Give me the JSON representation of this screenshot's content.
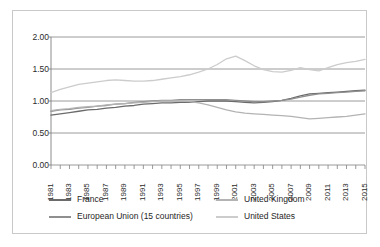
{
  "chart_data": {
    "type": "line",
    "title": "",
    "subtitle": "",
    "xlabel": "",
    "ylabel": "",
    "grid": true,
    "legend_position": "bottom",
    "ylim": [
      0.0,
      2.0
    ],
    "ytick_labels": [
      "2.00",
      "1.50",
      "1.00",
      "0.50",
      "0.00"
    ],
    "ytick_values": [
      2.0,
      1.5,
      1.0,
      0.5,
      0.0
    ],
    "xlim": [
      1981,
      2015
    ],
    "xtick_labels": [
      "1981",
      "1983",
      "1985",
      "1987",
      "1989",
      "1991",
      "1993",
      "1995",
      "1997",
      "1999",
      "2001",
      "2003",
      "2005",
      "2007",
      "2009",
      "2011",
      "2013",
      "2015"
    ],
    "x": [
      1981,
      1982,
      1983,
      1984,
      1985,
      1986,
      1987,
      1988,
      1989,
      1990,
      1991,
      1992,
      1993,
      1994,
      1995,
      1996,
      1997,
      1998,
      1999,
      2000,
      2001,
      2002,
      2003,
      2004,
      2005,
      2006,
      2007,
      2008,
      2009,
      2010,
      2011,
      2012,
      2013,
      2014,
      2015
    ],
    "series": [
      {
        "name": "France",
        "color": "#6b6b6b",
        "values": [
          0.78,
          0.8,
          0.82,
          0.84,
          0.86,
          0.87,
          0.89,
          0.9,
          0.92,
          0.93,
          0.95,
          0.96,
          0.97,
          0.97,
          0.98,
          0.98,
          0.99,
          1.0,
          1.0,
          1.0,
          0.99,
          0.98,
          0.97,
          0.98,
          0.99,
          1.01,
          1.04,
          1.08,
          1.11,
          1.12,
          1.13,
          1.14,
          1.15,
          1.16,
          1.17
        ]
      },
      {
        "name": "European Union (15 countries)",
        "color": "#8f8f8f",
        "values": [
          0.84,
          0.86,
          0.87,
          0.89,
          0.9,
          0.92,
          0.93,
          0.95,
          0.96,
          0.98,
          0.99,
          1.0,
          1.01,
          1.01,
          1.02,
          1.02,
          1.02,
          1.02,
          1.02,
          1.02,
          1.01,
          1.0,
          0.99,
          0.99,
          1.0,
          1.01,
          1.03,
          1.06,
          1.09,
          1.11,
          1.12,
          1.13,
          1.14,
          1.15,
          1.16
        ]
      },
      {
        "name": "United Kingdom",
        "color": "#b3b3b3",
        "values": [
          0.85,
          0.87,
          0.88,
          0.9,
          0.91,
          0.92,
          0.94,
          0.95,
          0.96,
          0.97,
          0.98,
          0.99,
          1.0,
          1.0,
          1.0,
          0.99,
          0.97,
          0.94,
          0.9,
          0.86,
          0.83,
          0.81,
          0.8,
          0.79,
          0.78,
          0.77,
          0.76,
          0.74,
          0.72,
          0.73,
          0.74,
          0.75,
          0.76,
          0.78,
          0.8
        ]
      },
      {
        "name": "United States",
        "color": "#cccccc",
        "values": [
          1.13,
          1.18,
          1.22,
          1.26,
          1.28,
          1.3,
          1.32,
          1.33,
          1.32,
          1.31,
          1.31,
          1.32,
          1.34,
          1.36,
          1.38,
          1.41,
          1.45,
          1.5,
          1.57,
          1.66,
          1.7,
          1.63,
          1.55,
          1.49,
          1.46,
          1.45,
          1.48,
          1.52,
          1.49,
          1.47,
          1.52,
          1.57,
          1.6,
          1.62,
          1.65
        ]
      }
    ]
  },
  "legend": {
    "items": [
      {
        "label": "France",
        "color": "#6b6b6b"
      },
      {
        "label": "European Union (15 countries)",
        "color": "#8f8f8f"
      },
      {
        "label": "United Kingdom",
        "color": "#b3b3b3"
      },
      {
        "label": "United States",
        "color": "#cccccc"
      }
    ]
  },
  "style": {
    "gridline_color": "#808080",
    "axis_color": "#808080",
    "border_color": "#c9c9c9",
    "background": "#ffffff"
  }
}
